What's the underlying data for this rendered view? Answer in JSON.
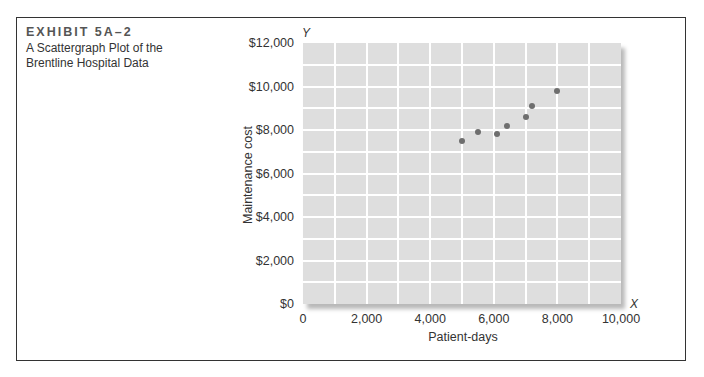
{
  "exhibit": {
    "label": "EXHIBIT 5A–2",
    "title_line1": "A Scattergraph Plot of the",
    "title_line2": "Brentline Hospital Data"
  },
  "chart_data": {
    "type": "scatter",
    "title": "A Scattergraph Plot of the Brentline Hospital Data",
    "xlabel": "Patient-days",
    "ylabel": "Maintenance cost",
    "x_axis_letter": "X",
    "y_axis_letter": "Y",
    "xlim": [
      0,
      10000
    ],
    "ylim": [
      0,
      12000
    ],
    "grid": true,
    "legend": null,
    "x_ticks": [
      "0",
      "2,000",
      "4,000",
      "6,000",
      "8,000",
      "10,000"
    ],
    "y_ticks": [
      "$0",
      "$2,000",
      "$4,000",
      "$6,000",
      "$8,000",
      "$10,000",
      "$12,000"
    ],
    "x_tick_values": [
      0,
      2000,
      4000,
      6000,
      8000,
      10000
    ],
    "y_tick_values": [
      0,
      2000,
      4000,
      6000,
      8000,
      10000,
      12000
    ],
    "series": [
      {
        "name": "Brentline Hospital",
        "color": "#6e6e6e",
        "points": [
          {
            "x": 5000,
            "y": 7500
          },
          {
            "x": 5500,
            "y": 7900
          },
          {
            "x": 6100,
            "y": 7800
          },
          {
            "x": 6400,
            "y": 8200
          },
          {
            "x": 7000,
            "y": 8600
          },
          {
            "x": 7200,
            "y": 9100
          },
          {
            "x": 8000,
            "y": 9800
          }
        ]
      }
    ]
  },
  "colors": {
    "plot_background": "#dedede",
    "gridlines": "#ffffff",
    "points": "#6e6e6e",
    "frame": "#333333"
  }
}
